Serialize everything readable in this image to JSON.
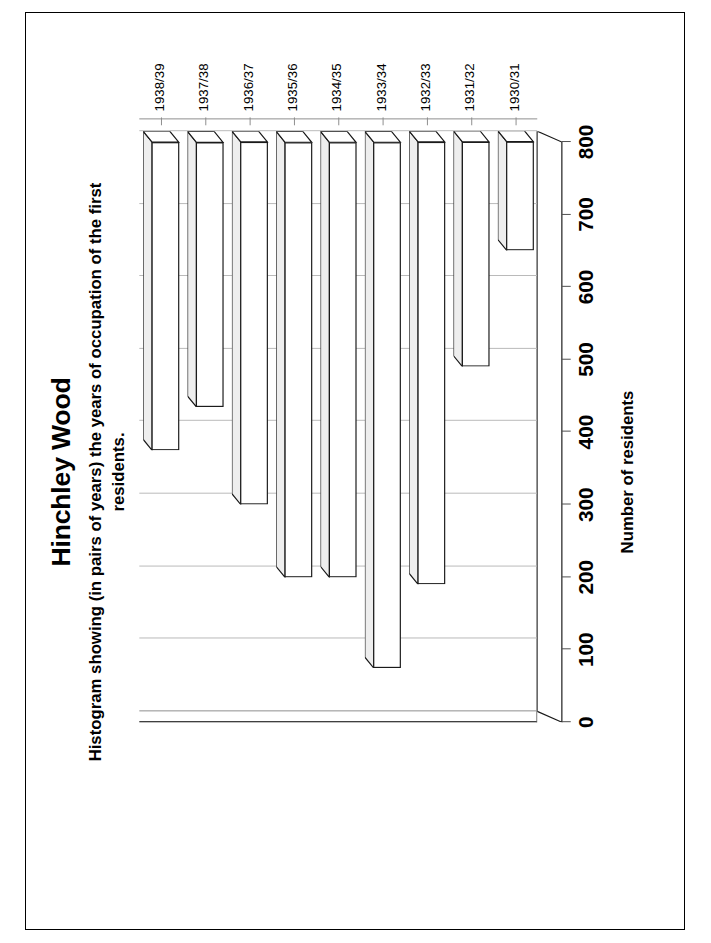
{
  "chart_data": {
    "type": "bar",
    "orientation": "horizontal-3d",
    "title": "Hinchley Wood",
    "subtitle": "Histogram showing (in pairs of years) the years of occupation of the first residents.",
    "xlabel": "Number of residents",
    "ylabel": "",
    "categories": [
      "1930/31",
      "1931/32",
      "1932/33",
      "1933/34",
      "1934/35",
      "1935/36",
      "1936/37",
      "1937/38",
      "1938/39"
    ],
    "values": [
      150,
      310,
      610,
      725,
      600,
      600,
      500,
      365,
      425
    ],
    "value_axis_ticks": [
      "0",
      "100",
      "200",
      "300",
      "400",
      "500",
      "600",
      "700",
      "800"
    ],
    "value_axis_tick_values": [
      0,
      100,
      200,
      300,
      400,
      500,
      600,
      700,
      800
    ],
    "xlim": [
      0,
      800
    ],
    "grid": "value-axis gridlines only",
    "legend": "none",
    "bar_fill": "#ffffff",
    "bar_outline": "#1a1a1a",
    "bar_top_fill": "#eeeeee",
    "gridline_color": "#b9b9b9",
    "axis_color": "#8d8d8d",
    "rotation_degrees": -90
  },
  "figure": {
    "title": "Hinchley Wood",
    "subtitle": "Histogram showing (in pairs of years) the years of occupation of the first residents.",
    "value_axis_title": "Number of residents"
  }
}
